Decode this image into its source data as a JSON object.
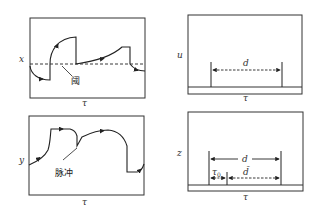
{
  "panels": {
    "x_panel": {
      "y_label": "x",
      "x_label": "τ",
      "annotation": "阈",
      "annotation_meaning": "threshold"
    },
    "y_panel": {
      "y_label": "y",
      "x_label": "τ",
      "annotation": "脉冲",
      "annotation_meaning": "pulse"
    },
    "u_panel": {
      "y_label": "u",
      "x_label": "τ",
      "interval_label": "d"
    },
    "z_panel": {
      "y_label": "z",
      "x_label": "τ",
      "interval_label": "d",
      "sub_interval_1_label": "τ",
      "sub_interval_1_subscript": "0",
      "sub_interval_2_label": "d̄"
    }
  },
  "colors": {
    "line": "#222222",
    "frame": "#333333",
    "background": "#ffffff"
  }
}
